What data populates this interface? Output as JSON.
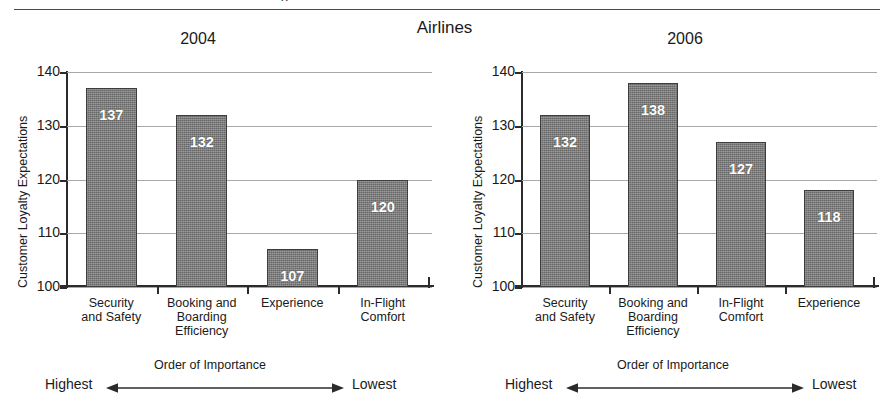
{
  "header": {
    "clipped_fragment": "g",
    "main_title": "Airlines"
  },
  "chart_data": [
    {
      "type": "bar",
      "title": "2004",
      "xlabel": "Order of Importance",
      "ylabel": "Customer Loyalty Expectations",
      "ylim": [
        100,
        140
      ],
      "yticks": [
        100,
        110,
        120,
        130,
        140
      ],
      "grid": true,
      "legend": "none",
      "categories": [
        "Security and Safety",
        "Booking and Boarding Efficiency",
        "Experience",
        "In-Flight Comfort"
      ],
      "category_lines": [
        [
          "Security",
          "and Safety"
        ],
        [
          "Booking and",
          "Boarding",
          "Efficiency"
        ],
        [
          "Experience"
        ],
        [
          "In-Flight",
          "Comfort"
        ]
      ],
      "values": [
        137,
        132,
        107,
        120
      ],
      "axis_direction_left": "Highest",
      "axis_direction_right": "Lowest"
    },
    {
      "type": "bar",
      "title": "2006",
      "xlabel": "Order of Importance",
      "ylabel": "Customer Loyalty Expectations",
      "ylim": [
        100,
        140
      ],
      "yticks": [
        100,
        110,
        120,
        130,
        140
      ],
      "grid": true,
      "legend": "none",
      "categories": [
        "Security and Safety",
        "Booking and Boarding Efficiency",
        "In-Flight Comfort",
        "Experience"
      ],
      "category_lines": [
        [
          "Security",
          "and Safety"
        ],
        [
          "Booking and",
          "Boarding",
          "Efficiency"
        ],
        [
          "In-Flight",
          "Comfort"
        ],
        [
          "Experience"
        ]
      ],
      "values": [
        132,
        138,
        127,
        118
      ],
      "axis_direction_left": "Highest",
      "axis_direction_right": "Lowest"
    }
  ],
  "colors": {
    "bar_fill": "#7d7d7d",
    "bar_edge": "#3d3d3d",
    "axis": "#2b2b2b",
    "gridline": "#a8a8a8",
    "value_text": "#ffffff",
    "text": "#1a1a1a",
    "background": "#ffffff"
  }
}
